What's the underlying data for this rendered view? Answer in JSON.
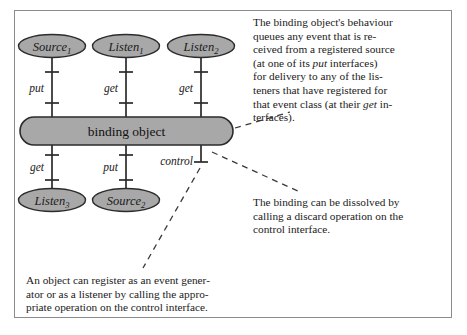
{
  "figure": {
    "border_color": "#8c8c8c",
    "shape_fill": "#a8a8a8",
    "shape_stroke": "#2b2b2b",
    "background": "#ffffff"
  },
  "diagram": {
    "binding_object": {
      "label": "binding object"
    },
    "top_nodes": [
      {
        "name": "Source",
        "sub": "1",
        "interface": "put"
      },
      {
        "name": "Listen",
        "sub": "1",
        "interface": "get"
      },
      {
        "name": "Listen",
        "sub": "2",
        "interface": "get"
      }
    ],
    "bottom_nodes": [
      {
        "name": "Listen",
        "sub": "3",
        "interface": "get"
      },
      {
        "name": "Source",
        "sub": "2",
        "interface": "put"
      }
    ],
    "control_interface": {
      "label": "control"
    }
  },
  "annotations": {
    "behaviour": {
      "lines": [
        "The binding object's behaviour",
        "queues any event that is re-",
        "ceived from a registered source",
        "(at one of its |put| interfaces)",
        "for delivery to any of the lis-",
        "teners that have registered for",
        "that event class (at their |get| in-",
        "terfaces)."
      ],
      "text": "The binding object's behaviour queues any event that is received from a registered source (at one of its put interfaces) for delivery to any of the listeners that have registered for that event class (at their get interfaces)."
    },
    "dissolve": {
      "lines": [
        "The binding can be dissolved by",
        "calling a discard operation on the",
        "control interface."
      ],
      "text": "The binding can be dissolved by calling a discard operation on the control interface."
    },
    "register": {
      "lines": [
        "An object can register as an event gener-",
        "ator or as a listener by calling the appro-",
        "priate operation on the control interface."
      ],
      "text": "An object can register as an event generator or as a listener by calling the appropriate operation on the control interface."
    }
  }
}
